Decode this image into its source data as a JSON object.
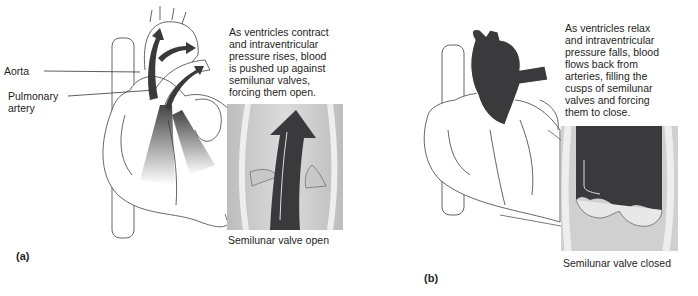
{
  "panels": [
    {
      "id": "a",
      "letter": "(a)",
      "description_lines": [
        "As ventricles contract",
        "and intraventricular",
        "pressure rises, blood",
        "is pushed up against",
        "semilunar valves,",
        "forcing them open."
      ],
      "labels": {
        "aorta": "Aorta",
        "pulmonary_artery_line1": "Pulmonary",
        "pulmonary_artery_line2": "artery"
      },
      "inset_caption": "Semilunar valve open"
    },
    {
      "id": "b",
      "letter": "(b)",
      "description_lines": [
        "As ventricles relax",
        "and intraventricular",
        "pressure falls, blood",
        "flows back from",
        "arteries, filling the",
        "cusps of semilunar",
        "valves and forcing",
        "them to close."
      ],
      "inset_caption": "Semilunar valve closed"
    }
  ],
  "colors": {
    "blood": "#3a3a3c",
    "outline": "#555555",
    "inset_bg": "#d8d8d8",
    "vessel_wall": "#ececec"
  }
}
